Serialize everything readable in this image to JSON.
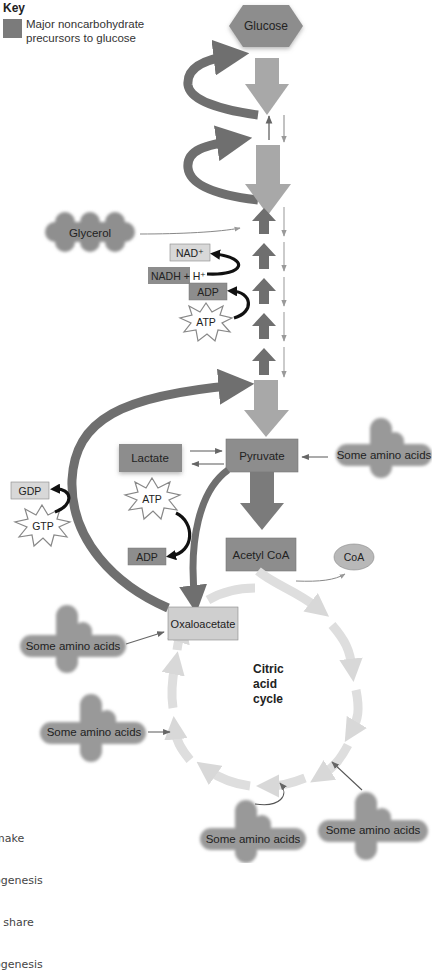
{
  "key": {
    "title": "Key",
    "swatch_color": "#7b7b7b",
    "description": "Major noncarbohydrate precursors to glucose"
  },
  "nodes": {
    "glucose": "Glucose",
    "glycerol": "Glycerol",
    "nad_plus": "NAD⁺",
    "nadh": "NADH + H⁺",
    "adp_top": "ADP",
    "atp_top": "ATP",
    "lactate": "Lactate",
    "pyruvate": "Pyruvate",
    "amino_right": "Some amino acids",
    "gdp": "GDP",
    "gtp": "GTP",
    "atp_mid": "ATP",
    "adp_mid": "ADP",
    "acetyl_coa": "Acetyl CoA",
    "coa": "CoA",
    "oxaloacetate": "Oxaloacetate",
    "amino_left_upper": "Some amino acids",
    "amino_left_lower": "Some amino acids",
    "amino_bottom_center": "Some amino acids",
    "amino_bottom_right": "Some amino acids",
    "citric_line1": "Citric",
    "citric_line2": "acid",
    "citric_line3": "cycle"
  },
  "caption_lines": [
    "make",
    "ogenesis",
    "s share",
    "ogenesis"
  ],
  "colors": {
    "dark_box": "#8a8a8a",
    "light_box": "#cfcfcf",
    "gluconeo_arrow": "#6f6f6f",
    "glycolysis_arrow": "#a8a8a8",
    "cycle_arrow": "#dcdcdc",
    "black_arrow": "#111111"
  }
}
